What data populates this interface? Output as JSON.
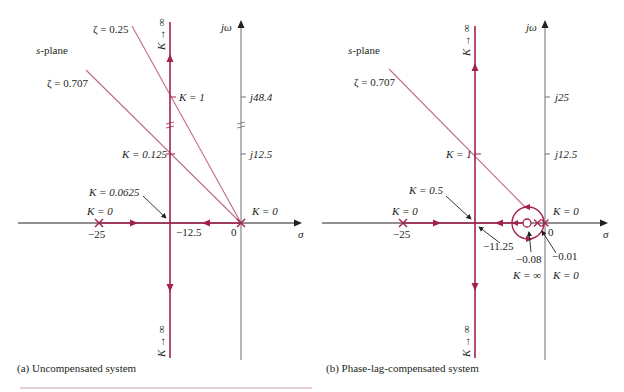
{
  "colors": {
    "locus": "#a3214e",
    "damping_line": "#c06a86",
    "axis": "#231f20",
    "axis_gray": "#6d6e70",
    "rule": "#c9a0b0"
  },
  "header_fragment": "",
  "panel_a": {
    "caption": "(a) Uncompensated system",
    "plane_label_s": "s",
    "plane_label_rest": "-plane",
    "jw_label": "jω",
    "sigma_label": "σ",
    "zeta1_label": "ζ = 0.25",
    "zeta2_label": "ζ = 0.707",
    "k_inf_up": "K → ∞",
    "k_inf_down": "K → ∞",
    "k1_label": "K = 1",
    "k0125_label": "K = 0.125",
    "k00625_label": "K = 0.0625",
    "k0_left_label": "K = 0",
    "k0_right_label": "K = 0",
    "tick_j484": "j48.4",
    "tick_j125": "j12.5",
    "tick_m25": "−25",
    "tick_m125": "−12.5",
    "tick_0": "0"
  },
  "panel_b": {
    "caption": "(b) Phase-lag-compensated system",
    "plane_label_s": "s",
    "plane_label_rest": "-plane",
    "jw_label": "jω",
    "sigma_label": "σ",
    "zeta_label": "ζ = 0.707",
    "k_inf_up": "K → ∞",
    "k_inf_down": "K → ∞",
    "k1_label": "K = 1",
    "k05_label": "K = 0.5",
    "k0_left_label": "K = 0",
    "k0_right_label": "K = 0",
    "tick_j25": "j25",
    "tick_j125": "j12.5",
    "tick_m25": "−25",
    "tick_m1125": "−11.25",
    "tick_0": "0",
    "zero_label": "−0.08",
    "pole_label": "−0.01",
    "k_inf_zero": "K = ∞",
    "k0_pole": "K = 0"
  }
}
